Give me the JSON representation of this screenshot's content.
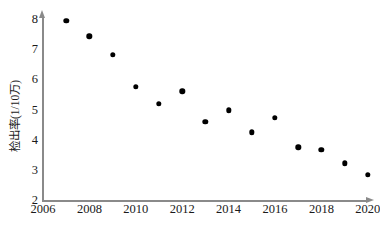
{
  "chart_data": {
    "type": "scatter",
    "title": "",
    "xlabel": "",
    "ylabel": "检出率(1/10万)",
    "x": [
      2007,
      2008,
      2009,
      2010,
      2011,
      2012,
      2013,
      2014,
      2015,
      2016,
      2017,
      2018,
      2019,
      2020
    ],
    "values": [
      7.92,
      7.42,
      6.8,
      5.75,
      5.18,
      5.6,
      4.6,
      4.97,
      4.25,
      4.73,
      3.75,
      3.67,
      3.22,
      2.85
    ],
    "xlim": [
      2006,
      2020
    ],
    "ylim": [
      2,
      8
    ],
    "xticks": [
      "2006",
      "2008",
      "2010",
      "2012",
      "2014",
      "2016",
      "2018",
      "2020"
    ],
    "xtick_values": [
      2006,
      2008,
      2010,
      2012,
      2014,
      2016,
      2018,
      2020
    ],
    "yticks": [
      "2",
      "3",
      "4",
      "5",
      "6",
      "7",
      "8"
    ],
    "ytick_values": [
      2,
      3,
      4,
      5,
      6,
      7,
      8
    ],
    "grid": false,
    "legend": null,
    "marker": "filled-circle",
    "marker_color": "#000000",
    "axis_color": "#8a8a8a",
    "x_axis_arrow": true,
    "y_axis_arrow": true
  }
}
